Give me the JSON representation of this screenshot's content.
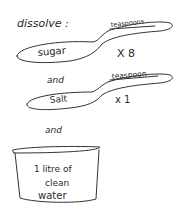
{
  "title": "dissolve :",
  "ingredients": [
    {
      "name": "sugar",
      "unit": "teaspoons",
      "quantity": "X 8"
    },
    {
      "name": "Salt",
      "unit": "teaspoon",
      "quantity": "x 1"
    }
  ],
  "connectors": [
    "and",
    "and"
  ],
  "container": {
    "line1": "1 litre of",
    "line2": "clean",
    "line3": "water"
  },
  "colors": {
    "ink": "#333333",
    "background": "#ffffff"
  }
}
